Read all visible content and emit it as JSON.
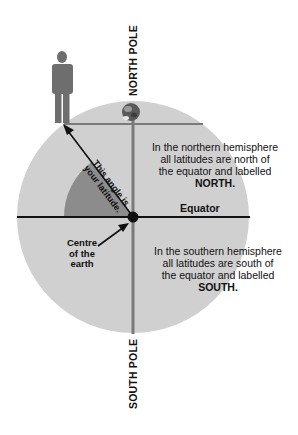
{
  "diagram": {
    "title_north": "NORTH POLE",
    "title_south": "SOUTH POLE",
    "equator_label": "Equator",
    "centre_label": [
      "Centre",
      "of the",
      "earth"
    ],
    "angle_label": [
      "This angle is",
      "your latitude."
    ],
    "north_text": [
      "In the northern hemisphere",
      "all latitudes are north of",
      "the equator and labelled"
    ],
    "north_emphasis": "NORTH.",
    "south_text": [
      "In the southern hemisphere",
      "all latitudes are south of",
      "the equator and labelled"
    ],
    "south_emphasis": "SOUTH.",
    "icons": {
      "person": "person-figure-icon",
      "polar_bear": "polar-bear-icon"
    },
    "colors": {
      "earth_fill": "#d0d0d0",
      "latitude_wedge": "#8c8c8c",
      "axis_line": "#7a7a7a",
      "person": "#6e6e6e",
      "equator_line": "#111111"
    }
  }
}
